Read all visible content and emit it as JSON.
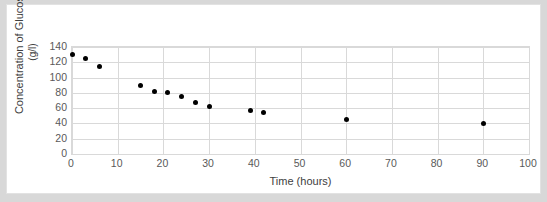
{
  "chart_data": {
    "type": "scatter",
    "title": "",
    "xlabel": "Time (hours)",
    "ylabel_line1": "Concentration of Glucose",
    "ylabel_line2": "(g/l)",
    "ylabel": "Concentration of Glucose (g/l)",
    "xlim": [
      0,
      100
    ],
    "ylim": [
      0,
      140
    ],
    "xticks": [
      0,
      10,
      20,
      30,
      40,
      50,
      60,
      70,
      80,
      90,
      100
    ],
    "yticks": [
      0,
      20,
      40,
      60,
      80,
      100,
      120,
      140
    ],
    "grid": "both",
    "legend": "none",
    "marker_color": "#000000",
    "gridline_color": "#d9d9d9",
    "background_color": "#ffffff",
    "frame_color": "#d8d8d8",
    "series": [
      {
        "name": "Glucose concentration",
        "x": [
          0,
          3,
          6,
          15,
          18,
          21,
          24,
          27,
          30,
          39,
          42,
          60,
          90
        ],
        "y": [
          130,
          125,
          115,
          90,
          82,
          80,
          75,
          67,
          62,
          57,
          54,
          45,
          40
        ]
      }
    ]
  }
}
